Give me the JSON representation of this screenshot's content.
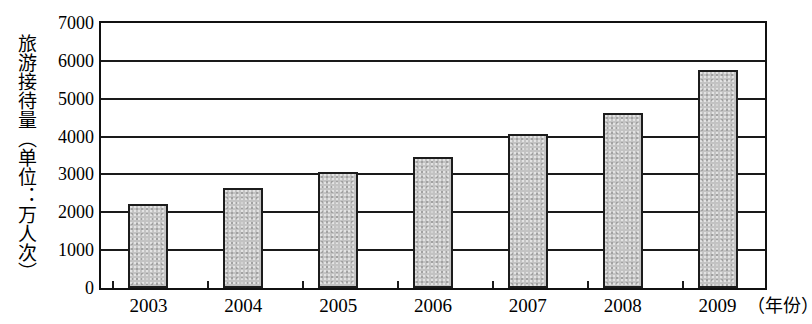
{
  "chart_data": {
    "type": "bar",
    "title": "",
    "subtitle": "",
    "xlabel": "年份",
    "xlabel_display": "（年份）",
    "ylabel": "旅游接待量（单位：万人次）",
    "categories": [
      "2003",
      "2004",
      "2005",
      "2006",
      "2007",
      "2008",
      "2009"
    ],
    "values": [
      2230,
      2650,
      3060,
      3450,
      4070,
      4630,
      5770
    ],
    "series": [
      {
        "name": "旅游接待量",
        "values": [
          2230,
          2650,
          3060,
          3450,
          4070,
          4630,
          5770
        ]
      }
    ],
    "ylim": [
      0,
      7000
    ],
    "ytick_values": [
      0,
      1000,
      2000,
      3000,
      4000,
      5000,
      6000,
      7000
    ],
    "ytick_labels": [
      "0",
      "1000",
      "2000",
      "3000",
      "4000",
      "5000",
      "6000",
      "7000"
    ],
    "grid": true,
    "grid_axis": "y",
    "legend": false,
    "legend_position": "none",
    "bar_fill_color": "#c3c3c3",
    "bar_edge_color": "#1c1c1c",
    "axis_color": "#111111",
    "background_color": "#ffffff"
  }
}
